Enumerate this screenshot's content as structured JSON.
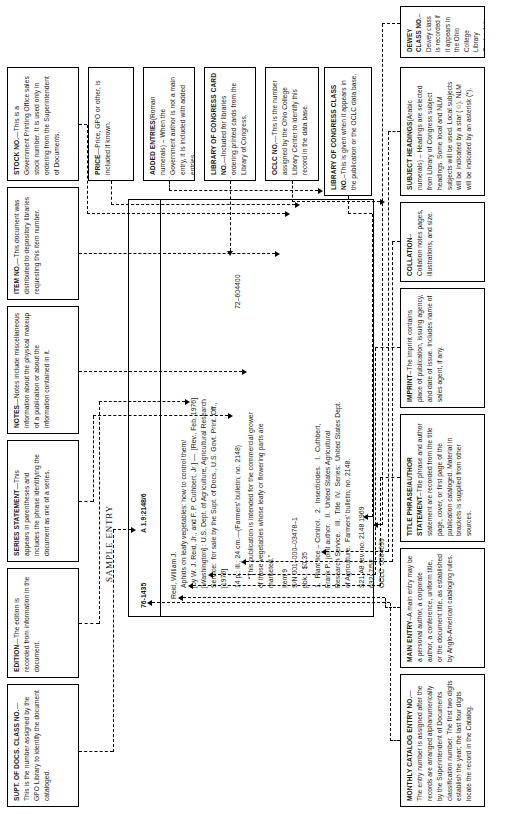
{
  "diagram": {
    "title": "SAMPLE ENTRY",
    "type": "annotated-library-catalog-entry"
  },
  "card": {
    "entry_number": "76-1435",
    "supt_docs_class_no": "A 1.9:2148/6",
    "main_entry": "Reid, William J.",
    "title_statement": "Aphids on leafy vegetables: how to control them/",
    "author_statement": "[by W. J. Reid, Jr., and F. P. Cuthbert, Jr.] —  [Rev., Feb. 1976]",
    "imprint_line1": "[Washington] : U.S. Dept. of Agriculture, Agricultural Research",
    "imprint_line2": "Service:  for sale by the Supt. of Docs., U.S. Govt. Print. Off.,",
    "imprint_line3": "[1976]",
    "collation": "14 p.: ill.; 24 cm.—(Farmers' bulletin; no. 2148)",
    "note_line1": "“This publication is intended for the commercial grower",
    "note_line2": "of those vegetables whose leafy or flowering parts are",
    "note_line3": "marketed.”",
    "item_no": "Item 9",
    "stock_no": "S/N 001–000–03478–1",
    "price": "pbk.:  $0.35",
    "subject_line1": "1.  Plant lice – Control.   2.  Insecticides.   I.  Cuthbert,",
    "subject_line2": "Frank P., joint author.   II.  United States Agricultural",
    "subject_line3": "Research Service.   III.  Title  IV.  Series:  United States Dept.",
    "subject_line4": "of Agriculture.  Farmers' bulletin; no. 2148.",
    "lc_class_no": "S21.A8 rev. no. 2148 1969",
    "dewey_class_no": "632/.7/52",
    "oclc_no": "OCLC  0084699",
    "lc_card_no": "72–604400"
  },
  "annotations_top": [
    {
      "id": "supt-of-docs-class-no",
      "title": "SUPT. OF DOCS. CLASS NO.",
      "body": "—This is the number assigned by the GPO Library to identify the document cataloged."
    },
    {
      "id": "edition",
      "title": "EDITION",
      "body": "—The edition is recorded from information in the document."
    },
    {
      "id": "series-statement",
      "title": "SERIES STATEMENT",
      "body": "—This appears in parentheses and includes the phrase identifying the document as one of a series."
    },
    {
      "id": "notes",
      "title": "NOTES",
      "body": "—Notes include miscellaneous information about the physical makeup of a publication or about the information contained in it."
    },
    {
      "id": "item-no",
      "title": "ITEM NO.",
      "body": "—This document was distributed to depository libraries requesting this item number."
    },
    {
      "id": "stock-no",
      "title": "STOCK NO.",
      "body": "—This is a Government Printing Office sales stock number.  It is used only in ordering from the Superintendent of Documents."
    },
    {
      "id": "price",
      "title": "PRICE",
      "body": "—Price, GPO or other, is included if known."
    },
    {
      "id": "added-entries",
      "title": "ADDED ENTRIES",
      "body": "(Roman numerals) – When the Government author is not a main entry, it is included with added entries."
    },
    {
      "id": "library-of-congress-card-no",
      "title": "LIBRARY OF CONGRESS CARD NO.",
      "body": "—Included for libraries ordering printed cards from the Library of Congress."
    },
    {
      "id": "oclc-no",
      "title": "OCLC NO.",
      "body": "—This is the number assigned by the Ohio College Library Center to identify this record in the data base."
    }
  ],
  "annotations_bottom": [
    {
      "id": "monthly-catalog-entry-no",
      "title": "MONTHLY CATALOG ENTRY NO.",
      "body": "—The entry number is assigned after the records are arranged alphanumerically by the Superintendent of Documents classification number.   The first two digits establish the year; the last four digits locate the record in the Catalog."
    },
    {
      "id": "main-entry",
      "title": "MAIN ENTRY",
      "body": "–A main entry may be a personal author, a corporate author, a conference, uniform title, or the document title, as established by Anglo-American cataloging rules."
    },
    {
      "id": "title-phrase-author-statement",
      "title": "TITLE PHRASE/AUTHOR STATEMENT",
      "body": "–Title phrase and author statement are recorded from the title page, cover, or first page of the publication cataloged.  Material in brackets is supplied from other sources."
    },
    {
      "id": "imprint",
      "title": "IMPRINT",
      "body": "–The imprint contains place of publication, issuing agency, and date of issue.  Includes name of sales agent, if any."
    },
    {
      "id": "collation",
      "title": "COLLATION",
      "body": "–Collation notes pages, illustrations, and size."
    },
    {
      "id": "subject-headings",
      "title": "SUBJECT HEADINGS",
      "body": "(Arabic numerals) – Headings are selected from Library of Congress subject headings.  Some local and NLM subjects will be used.  Local subjects will be indicated by a star (☆).  NLM will be indicated by an asterisk (*)."
    },
    {
      "id": "library-of-congress-class-no",
      "title": "LIBRARY OF CONGRESS CLASS NO.",
      "body": "–This is given when it appears in the publication or the OCLC data base."
    },
    {
      "id": "dewey-class-no",
      "title": "DEWEY CLASS NO.",
      "body": "–Dewey class is recorded if it appears in the Ohio College Library Center data base."
    }
  ]
}
